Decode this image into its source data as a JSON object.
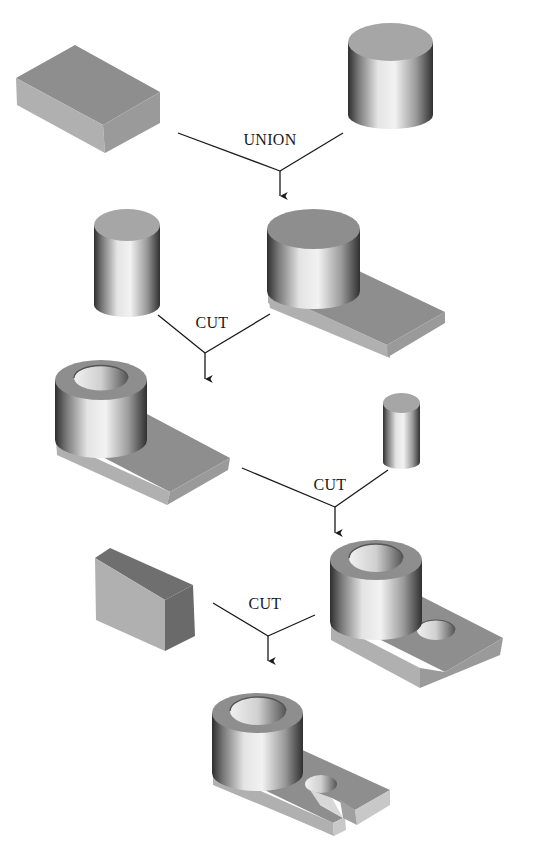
{
  "diagram": {
    "type": "csg-tree",
    "operations": [
      {
        "id": "op1",
        "label": "UNION",
        "label_pos": [
          270,
          131
        ],
        "inputs": [
          "rectangular-block",
          "large-cylinder"
        ],
        "output": "boss-on-plate"
      },
      {
        "id": "op2",
        "label": "CUT",
        "label_pos": [
          212,
          314
        ],
        "inputs": [
          "small-cylinder",
          "boss-on-plate"
        ],
        "output": "bored-boss-on-plate"
      },
      {
        "id": "op3",
        "label": "CUT",
        "label_pos": [
          335,
          476
        ],
        "inputs": [
          "bored-boss-on-plate",
          "pin-cylinder"
        ],
        "output": "part-with-hole"
      },
      {
        "id": "op4",
        "label": "CUT",
        "label_pos": [
          265,
          595
        ],
        "inputs": [
          "thin-block",
          "part-with-hole"
        ],
        "output": "final-slotted-part"
      }
    ],
    "solids": [
      {
        "name": "rectangular-block",
        "kind": "primitive-box"
      },
      {
        "name": "large-cylinder",
        "kind": "primitive-cylinder"
      },
      {
        "name": "small-cylinder",
        "kind": "primitive-cylinder"
      },
      {
        "name": "boss-on-plate",
        "kind": "intermediate"
      },
      {
        "name": "bored-boss-on-plate",
        "kind": "intermediate"
      },
      {
        "name": "pin-cylinder",
        "kind": "primitive-cylinder"
      },
      {
        "name": "part-with-hole",
        "kind": "intermediate"
      },
      {
        "name": "thin-block",
        "kind": "primitive-box"
      },
      {
        "name": "final-slotted-part",
        "kind": "result"
      }
    ],
    "colors": {
      "top_face": "#8e8e8e",
      "side_face": "#a9a9a9",
      "dark_face": "#6f6f6f",
      "line": "#1a1a1a"
    }
  },
  "labels": {
    "op1": "UNION",
    "op2": "CUT",
    "op3": "CUT",
    "op4": "CUT"
  }
}
